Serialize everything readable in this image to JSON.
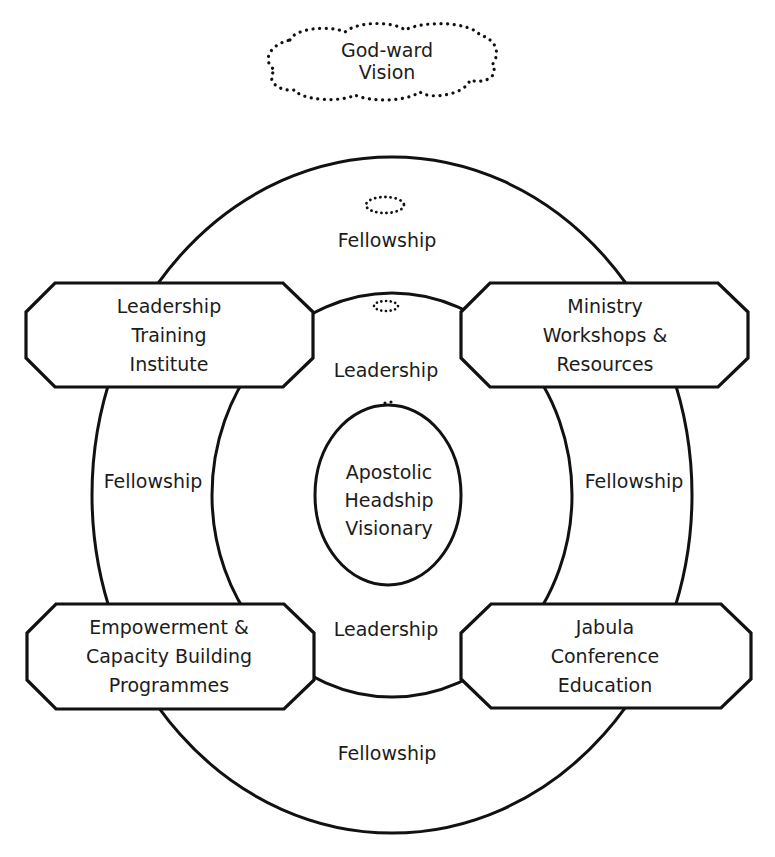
{
  "vision": {
    "line1": "God-ward",
    "line2": "Vision"
  },
  "center": {
    "line1": "Apostolic",
    "line2": "Headship",
    "line3": "Visionary"
  },
  "rings": {
    "outer_label": "Fellowship",
    "middle_label": "Leadership"
  },
  "ring_labels": {
    "fellowship_top": "Fellowship",
    "fellowship_left": "Fellowship",
    "fellowship_right": "Fellowship",
    "fellowship_bottom": "Fellowship",
    "leadership_top": "Leadership",
    "leadership_bottom": "Leadership"
  },
  "boxes": {
    "top_left": {
      "line1": "Leadership",
      "line2": "Training",
      "line3": "Institute"
    },
    "top_right": {
      "line1": "Ministry",
      "line2": "Workshops &",
      "line3": "Resources"
    },
    "bottom_left": {
      "line1": "Empowerment &",
      "line2": "Capacity Building",
      "line3": "Programmes"
    },
    "bottom_right": {
      "line1": "Jabula",
      "line2": "Conference",
      "line3": "Education"
    }
  },
  "colors": {
    "stroke": "#111111",
    "background": "#ffffff",
    "text": "#1c1c1c"
  }
}
